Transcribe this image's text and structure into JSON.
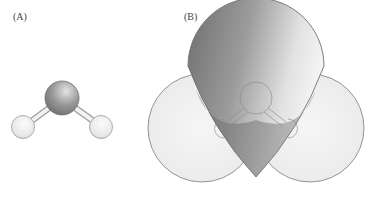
{
  "panels": [
    {
      "label": "(A)",
      "description": "ball-and-stick model of water molecule"
    },
    {
      "label": "(B)",
      "description": "space-filling model of water molecule"
    }
  ],
  "colors": {
    "oxygen_dark": "#6e6e6e",
    "oxygen_light": "#d8d8d8",
    "hydrogen_light": "#f4f4f4",
    "hydrogen_shade": "#c8c8c8",
    "outline": "#8a8a8a"
  }
}
